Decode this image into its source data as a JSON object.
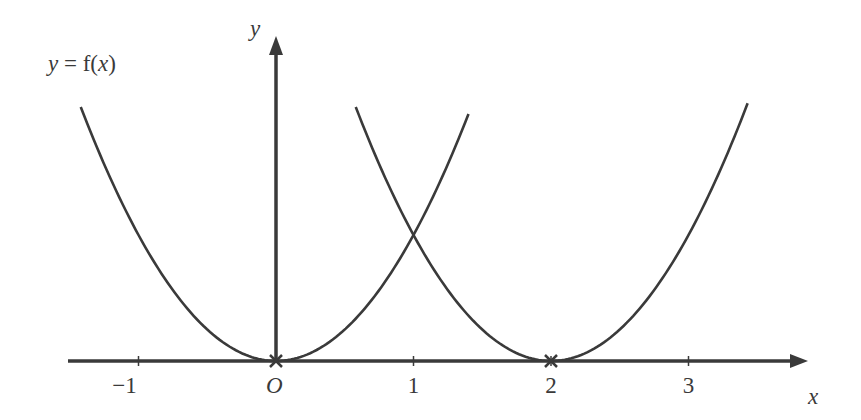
{
  "chart_data": {
    "type": "line",
    "title": "",
    "xlabel": "x",
    "ylabel": "y",
    "origin_label": "O",
    "curve_label": "y = f(x)",
    "x_ticks": [
      {
        "value": -1,
        "label": "−1"
      },
      {
        "value": 1,
        "label": "1"
      },
      {
        "value": 2,
        "label": "2"
      },
      {
        "value": 3,
        "label": "3"
      }
    ],
    "xlim": [
      -1.5,
      3.85
    ],
    "series": [
      {
        "name": "y = f(x)",
        "formula": "x^2",
        "x_range": [
          -1.42,
          1.4
        ]
      },
      {
        "name": "shifted",
        "formula": "(x-2)^2",
        "x_range": [
          0.58,
          3.43
        ]
      }
    ],
    "marked_points": [
      {
        "x": 0,
        "y": 0,
        "marker": "cross"
      },
      {
        "x": 2,
        "y": 0,
        "marker": "cross"
      }
    ],
    "grid": false,
    "color": "#3a3a3a"
  }
}
